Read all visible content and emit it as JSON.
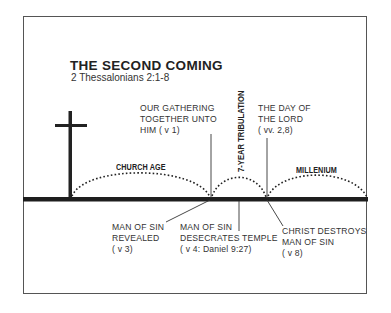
{
  "title": "THE SECOND COMING",
  "subtitle": "2 Thessalonians 2:1-8",
  "eras": {
    "church_age": "CHURCH AGE",
    "tribulation": "7-YEAR TRIBULATION",
    "millenium": "MILLENIUM"
  },
  "upper_labels": {
    "gathering": "OUR GATHERING\nTOGETHER UNTO\nHIM ( v 1)",
    "day_of_lord": "THE DAY OF\nTHE LORD\n( vv. 2,8)"
  },
  "lower_labels": {
    "revealed": "MAN OF SIN\nREVEALED\n( v 3)",
    "desecrates": "MAN OF SIN\nDESECRATES TEMPLE\n( v 4: Daniel 9:27)",
    "destroys": "CHRIST DESTROYS\nMAN OF SIN\n( v 8)"
  },
  "icons": {
    "cross": "cross-icon"
  },
  "colors": {
    "ink": "#222222",
    "frame": "#555555",
    "background": "#ffffff"
  }
}
